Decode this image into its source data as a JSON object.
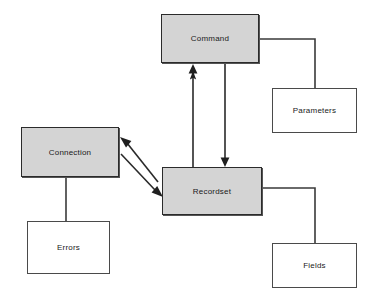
{
  "diagram": {
    "type": "object-model-diagram",
    "background_color": "#ffffff",
    "filled_node_color": "#d4d4d4",
    "line_color": "#333333",
    "nodes": [
      {
        "id": "command",
        "label": "Command",
        "style": "filled",
        "x": 161,
        "y": 14,
        "width": 98,
        "height": 49
      },
      {
        "id": "parameters",
        "label": "Parameters",
        "style": "plain",
        "x": 272,
        "y": 88,
        "width": 85,
        "height": 45
      },
      {
        "id": "connection",
        "label": "Connection",
        "style": "filled",
        "x": 21,
        "y": 127,
        "width": 98,
        "height": 50
      },
      {
        "id": "recordset",
        "label": "Recordset",
        "style": "filled",
        "x": 162,
        "y": 167,
        "width": 100,
        "height": 48
      },
      {
        "id": "errors",
        "label": "Errors",
        "style": "plain",
        "x": 27,
        "y": 221,
        "width": 83,
        "height": 53
      },
      {
        "id": "fields",
        "label": "Fields",
        "style": "plain",
        "x": 272,
        "y": 243,
        "width": 85,
        "height": 45
      }
    ],
    "edges": [
      {
        "id": "recordset-to-command",
        "from": "recordset",
        "to": "command",
        "arrow": "single",
        "direction": "up",
        "points": "193,167 193,66"
      },
      {
        "id": "command-to-recordset",
        "from": "command",
        "to": "recordset",
        "arrow": "single",
        "direction": "down",
        "points": "225,63 225,166"
      },
      {
        "id": "connection-recordset",
        "from": "connection",
        "to": "recordset",
        "arrow": "double",
        "direction": "bidirectional",
        "points": "121,138 162,195"
      },
      {
        "id": "command-parameters",
        "from": "command",
        "to": "parameters",
        "arrow": "none",
        "points": "259,39 315,39 315,88"
      },
      {
        "id": "connection-errors",
        "from": "connection",
        "to": "errors",
        "arrow": "none",
        "points": "66,177 66,221"
      },
      {
        "id": "recordset-fields",
        "from": "recordset",
        "to": "fields",
        "arrow": "none",
        "points": "262,188 315,188 315,243"
      }
    ]
  }
}
